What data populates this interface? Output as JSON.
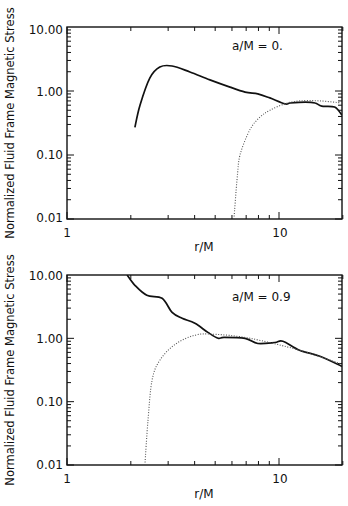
{
  "figure": {
    "panels_count": 2,
    "colors": {
      "axis": "#111111",
      "solid": "#111111",
      "dotted": "#555555",
      "background": "#ffffff"
    }
  },
  "chart_data": [
    {
      "type": "line",
      "title": "",
      "annotation": "a/M = 0.",
      "xlabel": "r/M",
      "ylabel": "Normalized Fluid Frame Magnetic Stress",
      "xscale": "log",
      "yscale": "log",
      "xlim": [
        1,
        20
      ],
      "ylim": [
        0.01,
        10
      ],
      "xticks": [
        1,
        10
      ],
      "xtick_labels": [
        "1",
        "10"
      ],
      "yticks": [
        0.01,
        0.1,
        1,
        10
      ],
      "ytick_labels": [
        "0.01",
        "0.10",
        "1.00",
        "10.00"
      ],
      "grid": false,
      "legend": null,
      "series": [
        {
          "name": "solid",
          "style": "solid",
          "x": [
            2.09,
            2.21,
            2.46,
            2.74,
            3.13,
            3.8,
            4.72,
            5.87,
            6.92,
            7.94,
            9.06,
            10.67,
            11.3,
            13.3,
            14.8,
            15.9,
            18.3,
            19.8
          ],
          "y": [
            0.27,
            0.6,
            1.6,
            2.37,
            2.46,
            1.98,
            1.49,
            1.15,
            0.96,
            0.9,
            0.78,
            0.63,
            0.65,
            0.67,
            0.65,
            0.58,
            0.56,
            0.42
          ]
        },
        {
          "name": "dotted",
          "style": "dotted",
          "x": [
            6.13,
            6.34,
            6.55,
            7.3,
            8.13,
            9.06,
            10.67,
            12.5,
            15.6,
            19.8
          ],
          "y": [
            0.01,
            0.041,
            0.1,
            0.25,
            0.39,
            0.5,
            0.63,
            0.7,
            0.7,
            0.65
          ]
        }
      ]
    },
    {
      "type": "line",
      "title": "",
      "annotation": "a/M = 0.9",
      "xlabel": "r/M",
      "ylabel": "Normalized Fluid Frame Magnetic Stress",
      "xscale": "log",
      "yscale": "log",
      "xlim": [
        1,
        20
      ],
      "ylim": [
        0.01,
        10
      ],
      "xticks": [
        1,
        10
      ],
      "xtick_labels": [
        "1",
        "10"
      ],
      "yticks": [
        0.01,
        0.1,
        1,
        10
      ],
      "ytick_labels": [
        "0.01",
        "0.10",
        "1.00",
        "10.00"
      ],
      "grid": false,
      "legend": null,
      "series": [
        {
          "name": "solid",
          "style": "solid",
          "x": [
            1.92,
            2.09,
            2.38,
            2.81,
            3.13,
            3.49,
            4.01,
            4.62,
            5.16,
            5.5,
            6.92,
            7.94,
            9.55,
            10.43,
            12.5,
            15.6,
            19.8
          ],
          "y": [
            10.0,
            6.87,
            4.78,
            4.28,
            2.57,
            2.07,
            1.73,
            1.24,
            1.0,
            1.04,
            1.0,
            0.83,
            0.86,
            0.9,
            0.65,
            0.52,
            0.36
          ]
        },
        {
          "name": "dotted",
          "style": "dotted",
          "x": [
            2.33,
            2.41,
            2.52,
            2.74,
            3.23,
            4.01,
            4.98,
            7.3,
            12.5,
            19.8
          ],
          "y": [
            0.01,
            0.051,
            0.22,
            0.45,
            0.8,
            1.12,
            1.16,
            1.0,
            0.65,
            0.39
          ]
        }
      ]
    }
  ]
}
